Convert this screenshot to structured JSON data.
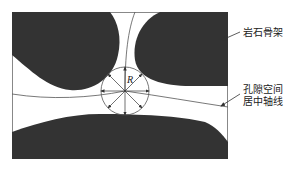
{
  "diagram": {
    "radius_label": "R",
    "labels": {
      "rock_skeleton": "岩石骨架",
      "pore_axis_line1": "孔隙空间",
      "pore_axis_line2": "居中轴线"
    },
    "colors": {
      "rock": "#333333",
      "line": "#555555",
      "background": "#ffffff"
    }
  }
}
